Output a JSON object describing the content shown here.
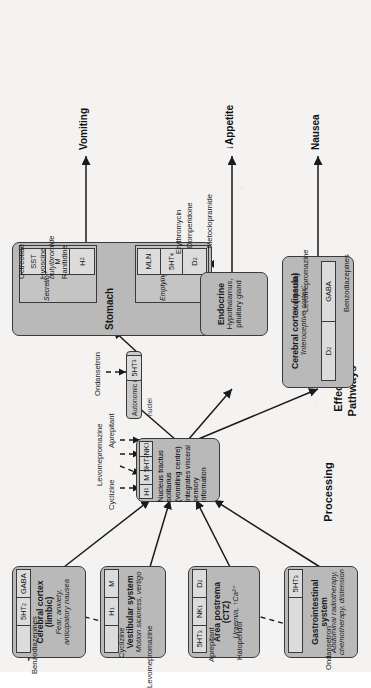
{
  "diagram": {
    "orientation": "rotated-90-ccw",
    "colors": {
      "node_fill": "#b9b9b9",
      "receptor_fill": "#dcdcdc",
      "panel_fill": "#c4c4c4",
      "stroke": "#3a3a3a",
      "page": "#f4f3f1",
      "text": "#1a1a1a"
    }
  },
  "sections": [
    {
      "id": "triggers",
      "label": "Triggers"
    },
    {
      "id": "processing",
      "label": "Processing"
    },
    {
      "id": "effector",
      "label": "Effector\nPathways"
    },
    {
      "id": "effector_line1",
      "label": "Effector"
    },
    {
      "id": "effector_line2",
      "label": "Pathways"
    }
  ],
  "nodes": {
    "cerebral_cortex_limbic": {
      "title": "Cerebral cortex (limbic)",
      "subtitle": "Fear, anxiety,\nanticipatory nausea",
      "subtitle_line1": "Fear, anxiety,",
      "subtitle_line2": "anticipatory nausea",
      "receptors": [
        "",
        "5HT₂",
        "GABA"
      ]
    },
    "vestibular_system": {
      "title": "Vestibular system",
      "subtitle_line1": "Motion sickness, vertigo",
      "receptors": [
        "",
        "H₁",
        "M"
      ]
    },
    "area_postrema": {
      "title_line1": "Area postrema",
      "title_line2": "(CTZ)",
      "subtitle_line1": "Uraemia, ↑Ca²⁺",
      "receptors": [
        "5HT₃",
        "NK₁",
        "D₂"
      ]
    },
    "gastrointestinal_system": {
      "title": "Gastrointestinal system",
      "subtitle_line1": "Abdominal radiotherapy,",
      "subtitle_line2": "chemotherapy, distension",
      "receptors": [
        "",
        "5HT₃"
      ]
    },
    "nucleus_tractus_solitarius": {
      "title_line1": "Nucleus tractus solitarius",
      "title_line2": "(vomiting centre)",
      "subtitle_line1": "Integrates visceral sensory",
      "subtitle_line2": "information",
      "receptors": [
        "H₁",
        "M",
        "5HT₂",
        "NK₁"
      ]
    },
    "autonomic_motor_nuclei": {
      "title": "Autonomic motor nuclei",
      "receptors": [
        "5HT₃"
      ]
    },
    "stomach": {
      "title": "Stomach",
      "groups": [
        {
          "label": "Emptying",
          "receptors": [
            "D₂",
            "5HT₄",
            "MLN"
          ]
        },
        {
          "label": "Secretions",
          "receptors": [
            "SST",
            "M",
            "H₂"
          ]
        }
      ]
    },
    "endocrine": {
      "title": "Endocrine",
      "subtitle_line1": "Hypothalamus,",
      "subtitle_line2": "pituitary gland"
    },
    "cerebral_cortex_insula": {
      "title": "Cerebral cortex (insula)",
      "subtitle_line1": "'Interoceptive cortex'",
      "receptors": [
        "D₂",
        "GABA"
      ]
    }
  },
  "drugs": {
    "benzodiazepines_limbic": "Benzodiazepines",
    "levomepromazine_vestibular": "Levomepromazine",
    "cyclizine_vestibular": "Cyclizine",
    "haloperidol_ctz": "Haloperidol",
    "aprepitant_ctz": "Aprepitant",
    "ondansetron_gi": "Ondansetron",
    "cyclizine_nts": "Cyclizine",
    "levomepromazine_nts": "Levomepromazine",
    "aprepitant_nts": "Aprepitant",
    "ondansetron_amn": "Ondansetron",
    "domperidone_stomach": "Domperidone",
    "metoclopramide_stomach": "Metoclopramide",
    "erythromycin_stomach": "Erythromycin",
    "octreotide_stomach": "Octreotide",
    "hyoscine_butylbromide_stomach_line1": "Hyoscine",
    "hyoscine_butylbromide_stomach_line2": "butylbromide",
    "ranitidine_stomach": "Ranitidine",
    "haloperidol_insula": "Haloperidol",
    "levomepromazine_insula": "Levomepromazine",
    "benzodiazepines_insula": "Benzodiazepines"
  },
  "outputs": [
    {
      "id": "vomiting",
      "label": "Vomiting"
    },
    {
      "id": "appetite",
      "label": "↓Appetite"
    },
    {
      "id": "nausea",
      "label": "Nausea"
    }
  ]
}
